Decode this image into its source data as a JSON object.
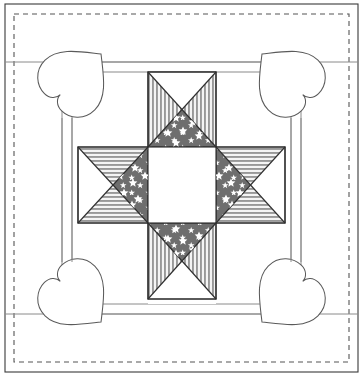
{
  "document": {
    "title": "Patriotic Star Quilt Block Pattern Diagram",
    "type": "line-drawing",
    "width": 363,
    "height": 376,
    "background_color": "#ffffff"
  },
  "colors": {
    "outline": "#3a3a3a",
    "thin_line": "#8a8a8a",
    "dashed_line": "#555555",
    "star_field": "#6b6b6b",
    "star_glyph": "#ffffff",
    "stripe_dark": "#8f8f8f",
    "stripe_light": "#f2f2f2",
    "plain_white": "#ffffff",
    "block_border": "#2f2f2f"
  },
  "frame": {
    "outer_border": {
      "name": "outer-solid-border",
      "x": 5,
      "y": 4,
      "width": 353,
      "height": 368,
      "stroke": "#3a3a3a",
      "stroke_width": 1.1,
      "fill": "none"
    },
    "dashed_border": {
      "name": "inner-dashed-stitch-line",
      "x": 14,
      "y": 14,
      "width": 335,
      "height": 348,
      "stroke": "#555555",
      "stroke_width": 1.1,
      "dash_pattern": "5 4",
      "fill": "none"
    },
    "inner_panel": {
      "name": "inner-sashing-panel",
      "x": 5,
      "y": 62,
      "width": 353,
      "height": 252,
      "stroke": "#8a8a8a",
      "stroke_width": 1
    },
    "horizontal_rules": [
      {
        "name": "upper-sashing-rule",
        "y": 62
      },
      {
        "name": "lower-sashing-rule",
        "y": 314
      }
    ],
    "vertical_rules": [
      {
        "name": "left-sashing-rule",
        "x": 62
      },
      {
        "name": "right-sashing-rule",
        "x": 301
      }
    ]
  },
  "sashing": {
    "name": "sashing-frame",
    "description": "Rectangular sashing strips framing the central star block",
    "outer": {
      "x": 62,
      "y": 62,
      "width": 239,
      "height": 252
    },
    "inner": {
      "x": 72,
      "y": 72,
      "width": 219,
      "height": 232
    },
    "stroke": "#8a8a8a",
    "stroke_width": 1
  },
  "center_block": {
    "name": "patriotic-star-block",
    "bounds": {
      "x": 78,
      "y": 72,
      "width": 207,
      "height": 232
    },
    "grid": {
      "columns": [
        78,
        148,
        216,
        285
      ],
      "rows": [
        72,
        147,
        223,
        291
      ]
    },
    "center_square": {
      "name": "center-white-square",
      "x": 148,
      "y": 147,
      "width": 68,
      "height": 76,
      "fill": "#ffffff",
      "stroke": "#2f2f2f"
    },
    "arms": [
      {
        "name": "arm-top",
        "orientation": "vertical",
        "x": 148,
        "y": 72,
        "width": 68,
        "height": 75,
        "triangles": [
          {
            "name": "arm-top-left-triangle",
            "fill": "stripes-vertical"
          },
          {
            "name": "arm-top-right-triangle",
            "fill": "stripes-vertical"
          },
          {
            "name": "arm-top-top-triangle",
            "fill": "plain-white"
          },
          {
            "name": "arm-top-bottom-triangle",
            "fill": "star-field"
          }
        ]
      },
      {
        "name": "arm-bottom",
        "orientation": "vertical",
        "x": 148,
        "y": 223,
        "width": 68,
        "height": 76,
        "triangles": [
          {
            "name": "arm-bottom-left-triangle",
            "fill": "stripes-vertical"
          },
          {
            "name": "arm-bottom-right-triangle",
            "fill": "stripes-vertical"
          },
          {
            "name": "arm-bottom-top-triangle",
            "fill": "star-field"
          },
          {
            "name": "arm-bottom-bottom-triangle",
            "fill": "plain-white"
          }
        ]
      },
      {
        "name": "arm-left",
        "orientation": "horizontal",
        "x": 78,
        "y": 147,
        "width": 70,
        "height": 76,
        "triangles": [
          {
            "name": "arm-left-top-triangle",
            "fill": "stripes-horizontal"
          },
          {
            "name": "arm-left-bottom-triangle",
            "fill": "stripes-horizontal"
          },
          {
            "name": "arm-left-left-triangle",
            "fill": "plain-white"
          },
          {
            "name": "arm-left-right-triangle",
            "fill": "star-field"
          }
        ]
      },
      {
        "name": "arm-right",
        "orientation": "horizontal",
        "x": 216,
        "y": 147,
        "width": 69,
        "height": 76,
        "triangles": [
          {
            "name": "arm-right-top-triangle",
            "fill": "stripes-horizontal"
          },
          {
            "name": "arm-right-bottom-triangle",
            "fill": "stripes-horizontal"
          },
          {
            "name": "arm-right-left-triangle",
            "fill": "star-field"
          },
          {
            "name": "arm-right-right-triangle",
            "fill": "plain-white"
          }
        ]
      }
    ],
    "corner_squares": [
      {
        "name": "corner-top-left",
        "x": 78,
        "y": 72,
        "fill": "plain-white"
      },
      {
        "name": "corner-top-right",
        "x": 216,
        "y": 72,
        "fill": "plain-white"
      },
      {
        "name": "corner-bottom-left",
        "x": 78,
        "y": 223,
        "fill": "plain-white"
      },
      {
        "name": "corner-bottom-right",
        "x": 216,
        "y": 223,
        "fill": "plain-white"
      }
    ],
    "star_points_count": 4,
    "star_glyph_count": 24
  },
  "hearts": [
    {
      "name": "heart-appliqué-top-left",
      "cx": 75,
      "cy": 80,
      "rotation_deg": 225,
      "scale": 0.8,
      "fill": "#ffffff",
      "stroke": "#5a5a5a"
    },
    {
      "name": "heart-appliqué-top-right",
      "cx": 288,
      "cy": 80,
      "rotation_deg": 135,
      "scale": 0.8,
      "fill": "#ffffff",
      "stroke": "#5a5a5a"
    },
    {
      "name": "heart-appliqué-bottom-left",
      "cx": 75,
      "cy": 296,
      "rotation_deg": 315,
      "scale": 0.8,
      "fill": "#ffffff",
      "stroke": "#5a5a5a"
    },
    {
      "name": "heart-appliqué-bottom-right",
      "cx": 288,
      "cy": 296,
      "rotation_deg": 45,
      "scale": 0.8,
      "fill": "#ffffff",
      "stroke": "#5a5a5a"
    }
  ],
  "star_positions": {
    "arm_top_bottom_triangle": [
      [
        160,
        122
      ],
      [
        176,
        118
      ],
      [
        193,
        122
      ],
      [
        205,
        130
      ],
      [
        168,
        133
      ],
      [
        183,
        131
      ],
      [
        199,
        136
      ],
      [
        176,
        143
      ]
    ],
    "arm_bottom_top_triangle": [
      [
        160,
        250
      ],
      [
        176,
        254
      ],
      [
        193,
        250
      ],
      [
        205,
        242
      ],
      [
        168,
        239
      ],
      [
        183,
        241
      ],
      [
        199,
        236
      ],
      [
        176,
        229
      ]
    ],
    "arm_left_right_triangle": [
      [
        124,
        160
      ],
      [
        120,
        176
      ],
      [
        124,
        193
      ],
      [
        132,
        205
      ],
      [
        135,
        168
      ],
      [
        133,
        183
      ],
      [
        138,
        199
      ],
      [
        145,
        176
      ]
    ],
    "arm_right_left_triangle": [
      [
        240,
        160
      ],
      [
        244,
        176
      ],
      [
        240,
        193
      ],
      [
        232,
        205
      ],
      [
        229,
        168
      ],
      [
        231,
        183
      ],
      [
        226,
        199
      ],
      [
        219,
        176
      ]
    ]
  }
}
